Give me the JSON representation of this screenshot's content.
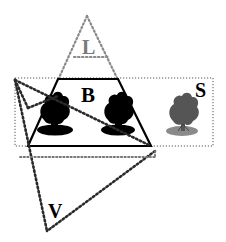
{
  "diagram": {
    "labels": {
      "L": "L",
      "B": "B",
      "S": "S",
      "V": "V"
    },
    "colors": {
      "solid_line": "#000000",
      "dotted_line": "#2a2a2a",
      "light_dotted": "#888888",
      "label_L": "#7a7a7a",
      "label_main": "#000000",
      "tree_dark": "#000000",
      "tree_gray": "#555555",
      "tree_ground_gray": "#8a8a8a"
    },
    "shapes": [
      {
        "id": "L",
        "type": "dotted-triangle",
        "description": "light triangle above trapezoid"
      },
      {
        "id": "B",
        "type": "solid-trapezoid",
        "description": "bold trapezoid containing two dark trees"
      },
      {
        "id": "S",
        "type": "dotted-rectangle",
        "description": "wide rectangle containing trees including gray tree"
      },
      {
        "id": "V",
        "type": "dotted-triangle",
        "description": "heavy triangle below pointing down"
      }
    ],
    "trees": [
      {
        "name": "tree-1",
        "style": "black"
      },
      {
        "name": "tree-2",
        "style": "black"
      },
      {
        "name": "tree-3",
        "style": "gray"
      }
    ]
  }
}
